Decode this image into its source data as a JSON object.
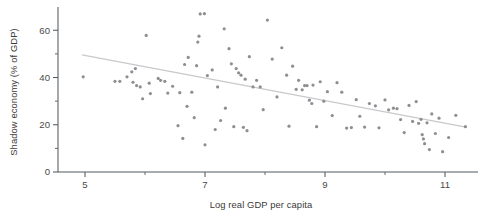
{
  "figure": {
    "title": "",
    "background_color": "#ffffff",
    "point_color": "#8e8e92",
    "trend_color": "#c9c9cd",
    "axis_color": "#555a5e"
  },
  "axes": {
    "y_label": "Shadow economy (% of GDP)",
    "x_label": "Log real GDP per capita",
    "y_ticks_major": [
      "0",
      "20",
      "40",
      "60"
    ],
    "y_ticks_minor": [
      "10",
      "30",
      "50"
    ],
    "x_ticks_major": [
      "5",
      "7",
      "9",
      "11"
    ],
    "x_ticks_minor": [
      "6",
      "8",
      "10"
    ]
  },
  "chart_data": {
    "type": "scatter",
    "title": "",
    "xlabel": "Log real GDP per capita",
    "ylabel": "Shadow economy (% of GDP)",
    "xlim": [
      4.55,
      11.55
    ],
    "ylim": [
      0,
      69
    ],
    "grid": false,
    "legend": "none",
    "y_ticks": [
      0,
      20,
      40,
      60
    ],
    "y_minor_ticks": [
      10,
      30,
      50
    ],
    "x_ticks": [
      5,
      6,
      7,
      8,
      9,
      10,
      11
    ],
    "x_tick_labels_shown": [
      5,
      7,
      9,
      11
    ],
    "marker": "circle",
    "marker_size_px": 3.2,
    "trendline": {
      "type": "linear",
      "x": [
        4.95,
        11.35
      ],
      "y": [
        49.6,
        19.0
      ],
      "slope": -4.78,
      "intercept": 73.3
    },
    "points": [
      {
        "x": 4.97,
        "y": 40.3
      },
      {
        "x": 5.5,
        "y": 38.4
      },
      {
        "x": 5.58,
        "y": 38.4
      },
      {
        "x": 5.7,
        "y": 40.3
      },
      {
        "x": 5.78,
        "y": 42.4
      },
      {
        "x": 5.8,
        "y": 38.0
      },
      {
        "x": 5.84,
        "y": 43.8
      },
      {
        "x": 5.86,
        "y": 36.6
      },
      {
        "x": 5.92,
        "y": 36.0
      },
      {
        "x": 5.96,
        "y": 31.0
      },
      {
        "x": 6.02,
        "y": 57.8
      },
      {
        "x": 6.07,
        "y": 37.6
      },
      {
        "x": 6.09,
        "y": 33.2
      },
      {
        "x": 6.22,
        "y": 39.6
      },
      {
        "x": 6.26,
        "y": 38.8
      },
      {
        "x": 6.33,
        "y": 38.4
      },
      {
        "x": 6.38,
        "y": 33.4
      },
      {
        "x": 6.46,
        "y": 36.3
      },
      {
        "x": 6.55,
        "y": 19.6
      },
      {
        "x": 6.58,
        "y": 33.6
      },
      {
        "x": 6.63,
        "y": 14.2
      },
      {
        "x": 6.66,
        "y": 45.5
      },
      {
        "x": 6.7,
        "y": 27.8
      },
      {
        "x": 6.72,
        "y": 48.5
      },
      {
        "x": 6.78,
        "y": 33.8
      },
      {
        "x": 6.82,
        "y": 23.0
      },
      {
        "x": 6.86,
        "y": 45.0
      },
      {
        "x": 6.88,
        "y": 55.0
      },
      {
        "x": 6.9,
        "y": 57.5
      },
      {
        "x": 6.92,
        "y": 66.9
      },
      {
        "x": 6.99,
        "y": 67.0
      },
      {
        "x": 7.0,
        "y": 11.5
      },
      {
        "x": 7.04,
        "y": 40.8
      },
      {
        "x": 7.12,
        "y": 43.2
      },
      {
        "x": 7.17,
        "y": 18.0
      },
      {
        "x": 7.21,
        "y": 36.0
      },
      {
        "x": 7.26,
        "y": 21.8
      },
      {
        "x": 7.32,
        "y": 60.6
      },
      {
        "x": 7.34,
        "y": 27.0
      },
      {
        "x": 7.4,
        "y": 52.2
      },
      {
        "x": 7.44,
        "y": 45.8
      },
      {
        "x": 7.48,
        "y": 19.2
      },
      {
        "x": 7.52,
        "y": 43.8
      },
      {
        "x": 7.56,
        "y": 42.0
      },
      {
        "x": 7.6,
        "y": 41.0
      },
      {
        "x": 7.64,
        "y": 18.9
      },
      {
        "x": 7.67,
        "y": 39.3
      },
      {
        "x": 7.7,
        "y": 17.5
      },
      {
        "x": 7.74,
        "y": 48.8
      },
      {
        "x": 7.8,
        "y": 36.0
      },
      {
        "x": 7.86,
        "y": 38.8
      },
      {
        "x": 7.92,
        "y": 36.0
      },
      {
        "x": 7.97,
        "y": 26.4
      },
      {
        "x": 8.04,
        "y": 64.3
      },
      {
        "x": 8.12,
        "y": 47.8
      },
      {
        "x": 8.2,
        "y": 31.8
      },
      {
        "x": 8.28,
        "y": 52.6
      },
      {
        "x": 8.36,
        "y": 41.0
      },
      {
        "x": 8.4,
        "y": 19.4
      },
      {
        "x": 8.46,
        "y": 44.8
      },
      {
        "x": 8.52,
        "y": 35.0
      },
      {
        "x": 8.56,
        "y": 38.8
      },
      {
        "x": 8.62,
        "y": 34.8
      },
      {
        "x": 8.66,
        "y": 36.6
      },
      {
        "x": 8.7,
        "y": 36.6
      },
      {
        "x": 8.74,
        "y": 30.4
      },
      {
        "x": 8.78,
        "y": 29.0
      },
      {
        "x": 8.8,
        "y": 36.8
      },
      {
        "x": 8.86,
        "y": 19.2
      },
      {
        "x": 8.92,
        "y": 38.2
      },
      {
        "x": 8.98,
        "y": 30.0
      },
      {
        "x": 9.04,
        "y": 34.0
      },
      {
        "x": 9.12,
        "y": 23.9
      },
      {
        "x": 9.2,
        "y": 37.8
      },
      {
        "x": 9.28,
        "y": 33.8
      },
      {
        "x": 9.36,
        "y": 18.6
      },
      {
        "x": 9.44,
        "y": 18.8
      },
      {
        "x": 9.52,
        "y": 30.6
      },
      {
        "x": 9.58,
        "y": 23.6
      },
      {
        "x": 9.66,
        "y": 19.0
      },
      {
        "x": 9.74,
        "y": 29.0
      },
      {
        "x": 9.84,
        "y": 28.0
      },
      {
        "x": 9.9,
        "y": 18.7
      },
      {
        "x": 10.0,
        "y": 30.5
      },
      {
        "x": 10.06,
        "y": 26.3
      },
      {
        "x": 10.14,
        "y": 27.0
      },
      {
        "x": 10.2,
        "y": 26.8
      },
      {
        "x": 10.26,
        "y": 22.2
      },
      {
        "x": 10.32,
        "y": 16.7
      },
      {
        "x": 10.4,
        "y": 28.2
      },
      {
        "x": 10.46,
        "y": 21.4
      },
      {
        "x": 10.52,
        "y": 29.8
      },
      {
        "x": 10.56,
        "y": 20.6
      },
      {
        "x": 10.6,
        "y": 22.3
      },
      {
        "x": 10.62,
        "y": 15.8
      },
      {
        "x": 10.64,
        "y": 14.0
      },
      {
        "x": 10.66,
        "y": 12.0
      },
      {
        "x": 10.7,
        "y": 20.8
      },
      {
        "x": 10.74,
        "y": 9.5
      },
      {
        "x": 10.78,
        "y": 24.6
      },
      {
        "x": 10.84,
        "y": 16.3
      },
      {
        "x": 10.9,
        "y": 22.8
      },
      {
        "x": 10.96,
        "y": 8.6
      },
      {
        "x": 11.06,
        "y": 14.6
      },
      {
        "x": 11.18,
        "y": 24.0
      },
      {
        "x": 11.34,
        "y": 19.2
      }
    ]
  }
}
